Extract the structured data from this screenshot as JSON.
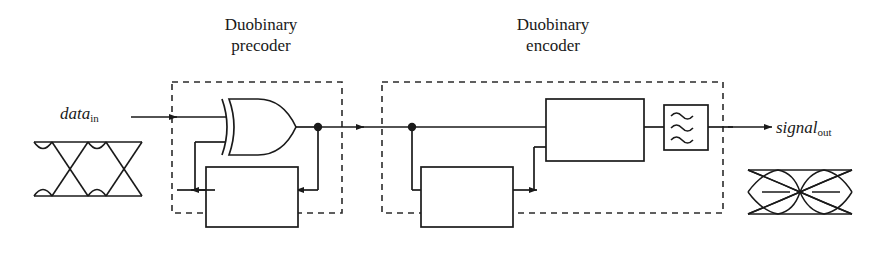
{
  "diagram": {
    "groups": [
      {
        "id": "precoder",
        "line1": "Duobinary",
        "line2": "precoder"
      },
      {
        "id": "encoder",
        "line1": "Duobinary",
        "line2": "encoder"
      }
    ],
    "io": {
      "input_base": "data",
      "input_sub": "in",
      "output_base": "signal",
      "output_sub": "out"
    },
    "blocks": [
      {
        "id": "precoder-delay",
        "line1": "k-bit",
        "line2": "delay",
        "italic_first": "k"
      },
      {
        "id": "encoder-delay",
        "line1": "k-bit",
        "line2": "delay",
        "italic_first": "k"
      },
      {
        "id": "add-subtract",
        "line1": "add/",
        "line2": "subtract"
      }
    ],
    "gates": [
      {
        "id": "xor-gate",
        "type": "XOR"
      }
    ],
    "filter": {
      "id": "lowpass-filter",
      "type": "lowpass",
      "wave_count": 3
    },
    "eyes": [
      {
        "id": "input-eye",
        "levels": 2,
        "label": "binary NRZ eye diagram"
      },
      {
        "id": "output-eye",
        "levels": 3,
        "label": "three-level duobinary eye diagram"
      }
    ],
    "colors": {
      "stroke": "#1a1a1a",
      "dashed": "#2b2b2b",
      "background": "#ffffff"
    }
  }
}
